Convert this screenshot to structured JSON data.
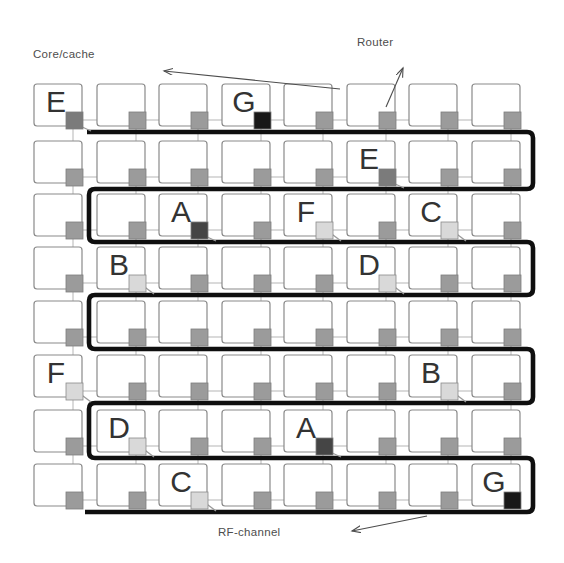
{
  "figure": {
    "grid_rows": 8,
    "grid_cols": 8
  },
  "labels": {
    "core_cache": "Core/cache",
    "router": "Router",
    "rf_channel": "RF-channel"
  },
  "colors": {
    "background": "#ffffff",
    "tile_fill": "#ffffff",
    "tile_border": "#8a8a8a",
    "mesh_link": "#b5b5b5",
    "rf_channel": "#0f0f0f",
    "router_default": "#9b9b9b",
    "router_border": "#7d7d7d",
    "router_medium": "#7b7b7b",
    "router_dark": "#454545",
    "router_black": "#181818",
    "router_light": "#d9d9d9",
    "connector": "#9a9a9a",
    "annotation": "#4d4d4d",
    "letter_text": "#333333"
  },
  "nodes": [
    {
      "row": 0,
      "col": 0,
      "letter": "E",
      "router_shade": "medium",
      "connector": true
    },
    {
      "row": 0,
      "col": 3,
      "letter": "G",
      "router_shade": "black",
      "connector": false
    },
    {
      "row": 1,
      "col": 5,
      "letter": "E",
      "router_shade": "medium",
      "connector": true
    },
    {
      "row": 2,
      "col": 2,
      "letter": "A",
      "router_shade": "dark",
      "connector": true
    },
    {
      "row": 2,
      "col": 4,
      "letter": "F",
      "router_shade": "light",
      "connector": true
    },
    {
      "row": 2,
      "col": 6,
      "letter": "C",
      "router_shade": "light",
      "connector": true
    },
    {
      "row": 3,
      "col": 1,
      "letter": "B",
      "router_shade": "light",
      "connector": true
    },
    {
      "row": 3,
      "col": 5,
      "letter": "D",
      "router_shade": "light",
      "connector": true
    },
    {
      "row": 5,
      "col": 0,
      "letter": "F",
      "router_shade": "light",
      "connector": true
    },
    {
      "row": 5,
      "col": 6,
      "letter": "B",
      "router_shade": "light",
      "connector": true
    },
    {
      "row": 6,
      "col": 1,
      "letter": "D",
      "router_shade": "light",
      "connector": true
    },
    {
      "row": 6,
      "col": 4,
      "letter": "A",
      "router_shade": "dark",
      "connector": true
    },
    {
      "row": 7,
      "col": 2,
      "letter": "C",
      "router_shade": "light",
      "connector": true
    },
    {
      "row": 7,
      "col": 7,
      "letter": "G",
      "router_shade": "black",
      "connector": false
    }
  ]
}
